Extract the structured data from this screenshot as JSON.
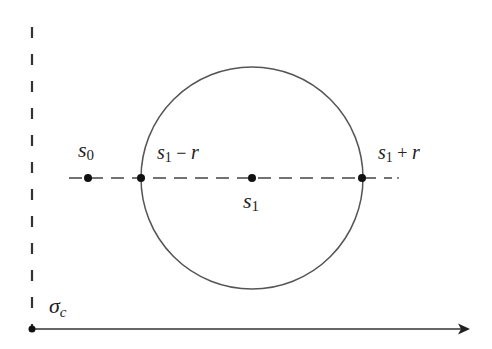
{
  "diagram": {
    "type": "disk-on-half-plane",
    "colors": {
      "stroke": "#555555",
      "point": "#111111",
      "text": "#222222",
      "background": "#ffffff"
    },
    "circle": {
      "cx": 252,
      "cy": 178,
      "r": 111
    },
    "labels": {
      "s0": {
        "base": "s",
        "sub": "0"
      },
      "s1_minus_r": {
        "base": "s",
        "sub": "1",
        "op": " − ",
        "tail": "r"
      },
      "s1": {
        "base": "s",
        "sub": "1"
      },
      "s1_plus_r": {
        "base": "s",
        "sub": "1",
        "op": " + ",
        "tail": "r"
      },
      "sigma_c": {
        "base": "σ",
        "sub": "c"
      }
    },
    "points": [
      {
        "name": "s0",
        "x": 88,
        "y": 178
      },
      {
        "name": "s1-r",
        "x": 141,
        "y": 178
      },
      {
        "name": "s1",
        "x": 252,
        "y": 178
      },
      {
        "name": "s1+r",
        "x": 362,
        "y": 178
      },
      {
        "name": "sigma_c",
        "x": 32,
        "y": 329
      }
    ]
  }
}
